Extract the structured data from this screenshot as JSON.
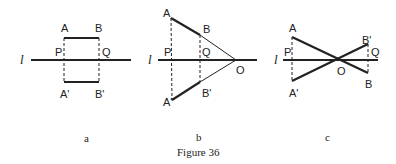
{
  "figure": {
    "caption": "Figure 36",
    "panels": [
      {
        "sublabel": "a",
        "line_label": "l",
        "points": {
          "A": "A",
          "B": "B",
          "P": "P",
          "Q": "Q",
          "A_prime": "A'",
          "B_prime": "B'"
        }
      },
      {
        "sublabel": "b",
        "line_label": "l",
        "points": {
          "A": "A",
          "B": "B",
          "P": "P",
          "Q": "Q",
          "O": "O",
          "A_prime": "A'",
          "B_prime": "B'"
        }
      },
      {
        "sublabel": "c",
        "line_label": "l",
        "points": {
          "A": "A",
          "B": "B",
          "P": "P",
          "Q": "Q",
          "O": "O",
          "A_prime": "A'",
          "B_prime": "B'"
        }
      }
    ]
  },
  "colors": {
    "ink": "#222222",
    "background": "#ffffff"
  }
}
